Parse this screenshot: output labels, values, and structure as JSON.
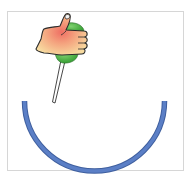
{
  "illustration": {
    "subject": "hand holding pushpin above arc",
    "colors": {
      "frame_border": "#d6d6d6",
      "arc_fill": "#5b7fc6",
      "arc_outline": "#3f5f9e",
      "pin_head": "#3fae3a",
      "pin_head_highlight": "#7fd16f",
      "needle": "#ffffff",
      "needle_outline": "#333333",
      "hand_light": "#f7dba0",
      "hand_mid": "#f4a27e",
      "hand_center": "#ef6e63",
      "outline": "#2b2b2b"
    },
    "arc": {
      "cx": 94.5,
      "cy": 95,
      "radius": 70,
      "stroke_width": 4
    },
    "icons": [
      "hand-icon",
      "pushpin-icon",
      "arc-shape"
    ]
  }
}
